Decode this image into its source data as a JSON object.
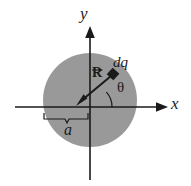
{
  "figure": {
    "background_color": "#ffffff",
    "disk_fill_color": "#999999",
    "line_color": "#1a1a1a"
  },
  "axes": {
    "x_label": "x",
    "y_label": "y",
    "origin": {
      "x": 90,
      "y": 107
    },
    "x_axis": {
      "start_x": 15,
      "end_x": 168,
      "y": 107
    },
    "y_axis": {
      "x": 90,
      "start_y": 30,
      "end_y": 180
    }
  },
  "disk": {
    "center_x": 90,
    "center_y": 100,
    "radius": 47,
    "radius_label": "a"
  },
  "charge_element": {
    "label": "dq",
    "marker_x": 113,
    "marker_y": 74
  },
  "vector": {
    "label": "R",
    "accent": "vector-arrow-overbar",
    "from_x": 113,
    "from_y": 74,
    "to_x": 78,
    "to_y": 104
  },
  "angle": {
    "label": "θ",
    "measured_from": "x-axis",
    "arc_radius": 22
  },
  "dimension_brace": {
    "label": "a",
    "left_x": 44,
    "right_x": 90,
    "y": 113,
    "tick_y": 120
  }
}
